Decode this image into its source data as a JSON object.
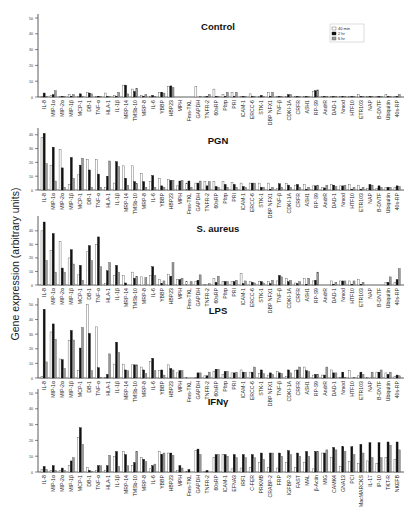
{
  "figure": {
    "ylabel": "Gene expression (arbitrary units)",
    "legend": [
      {
        "label": "40 min",
        "color": "#ffffff",
        "stroke": "#555555"
      },
      {
        "label": "2 hr",
        "color": "#111111",
        "stroke": "#111111"
      },
      {
        "label": "6 hr",
        "color": "#9a9a9a",
        "stroke": "#555555"
      }
    ]
  },
  "chart_data": [
    {
      "type": "bar",
      "title": "Control",
      "ylabel": "Gene expression (arbitrary units)",
      "ylim": [
        0,
        50
      ],
      "yticks": [
        0,
        10,
        20,
        30,
        40,
        50
      ],
      "legend_position": "top-right",
      "categories": [
        "IL-8",
        "MIP-1α",
        "MIP-2α",
        "MIP-1β",
        "MCP-1",
        "DB-1",
        "TNF-α",
        "HLA-1",
        "IL-1β",
        "MRP-14",
        "TMSb-10",
        "MRP-8",
        "IL-6",
        "YBBP",
        "HBP23",
        "MPH",
        "Fms-TKL",
        "GAPDH",
        "TNFR-2",
        "60sRP",
        "Pltrp",
        "PRI",
        "ICAM-1",
        "ERCC-6",
        "STK-1",
        "DBP NFX1",
        "TNF-β",
        "CDKI-1A",
        "CRFR",
        "ASH1",
        "RP-S9",
        "AndrR",
        "DAD-1",
        "Nmod",
        "HTF10",
        "ETR103",
        "NAP",
        "B-DNTF",
        "Ubiquitin",
        "40s-RP"
      ],
      "series": [
        {
          "name": "40 min",
          "values": [
            0.5,
            1,
            0.3,
            1.5,
            0.5,
            3,
            0.5,
            2.5,
            1,
            7.5,
            5,
            1,
            0.5,
            3,
            6.5,
            0,
            0,
            6.5,
            0.5,
            5,
            1.5,
            3,
            0.3,
            2,
            0.3,
            3,
            0.3,
            0.5,
            0.3,
            0.3,
            3.5,
            0.3,
            0.3,
            0.3,
            0.3,
            1.5,
            0.3,
            0.3,
            1.5,
            0.3
          ]
        },
        {
          "name": "2 hr",
          "values": [
            2.5,
            1.5,
            0.3,
            0.5,
            2,
            2.5,
            0.5,
            0.3,
            0.5,
            7.5,
            3.5,
            0.5,
            1,
            3,
            7,
            0,
            0,
            0,
            0.3,
            0.3,
            0.3,
            0.3,
            0.3,
            0.3,
            1,
            0.3,
            0.3,
            1.5,
            0.3,
            0.3,
            4,
            0.3,
            0.3,
            0.3,
            0.3,
            0.3,
            0.3,
            0.3,
            0.3,
            0.3
          ]
        },
        {
          "name": "6 hr",
          "values": [
            0.5,
            4,
            0.3,
            1.5,
            0.5,
            2,
            0.5,
            0.3,
            3,
            2,
            5.5,
            1.5,
            0.5,
            2.5,
            6,
            0,
            0,
            0.3,
            1.5,
            0.3,
            3,
            3,
            0.3,
            0.3,
            0.3,
            3,
            0.3,
            1.5,
            0.3,
            0.3,
            4.5,
            0.3,
            0.3,
            0.3,
            0.3,
            0.3,
            0.3,
            0.3,
            0.3,
            1.5
          ]
        }
      ]
    },
    {
      "type": "bar",
      "title": "PGN",
      "ylabel": "Gene expression (arbitrary units)",
      "ylim": [
        0,
        42
      ],
      "yticks": [
        0,
        10,
        20,
        30,
        40
      ],
      "categories": [
        "IL-8",
        "MIP-1α",
        "MIP-2α",
        "MIP-1β",
        "MCP-1",
        "DB-1",
        "TNF-α",
        "HLA-1",
        "IL-1β",
        "MRP-14",
        "TMSb-10",
        "MRP-8",
        "IL-6",
        "YBBP",
        "HBP23",
        "MPH",
        "Fms-TKL",
        "GAPDH",
        "TNFR-2",
        "60sRP",
        "Pltrp",
        "PRI",
        "ICAM-1",
        "ERCC-6",
        "STK-1",
        "DBP NFX1",
        "TNF-β",
        "CDKI-1A",
        "CRFR",
        "ASH1",
        "RP-S9",
        "AndrR",
        "DAD-1",
        "Nmod",
        "HTF10",
        "ETR103",
        "NAP",
        "B-DNTF",
        "Ubiquitin",
        "40s-RP"
      ],
      "series": [
        {
          "name": "40 min",
          "values": [
            38,
            18,
            29.5,
            4,
            11,
            22,
            22,
            2,
            5,
            17.5,
            17.5,
            12,
            6,
            8.5,
            7.5,
            3,
            5,
            5,
            6,
            6,
            6,
            5.5,
            5,
            5,
            5,
            5,
            1,
            4.5,
            3.5,
            4,
            3,
            2,
            4,
            3,
            4,
            3.5,
            1,
            1,
            2,
            2
          ]
        },
        {
          "name": "2 hr",
          "values": [
            41,
            31,
            16,
            23.5,
            18,
            14.5,
            11.5,
            10,
            20.5,
            8.5,
            6,
            6,
            10.5,
            3,
            7,
            6.5,
            6.5,
            5,
            3,
            2.5,
            4,
            4,
            2.5,
            5,
            2,
            0.5,
            4.5,
            3.5,
            4,
            0.5,
            3,
            1.5,
            3.5,
            3,
            0.5,
            0.5,
            4,
            3,
            2,
            3
          ]
        },
        {
          "name": "6 hr",
          "values": [
            19,
            6.5,
            2,
            8.5,
            23,
            2,
            2,
            21,
            17,
            3.5,
            4.5,
            2,
            2,
            2,
            7,
            7,
            2,
            6.5,
            6,
            2,
            2,
            2,
            2,
            5,
            2,
            2,
            2,
            2,
            2,
            2,
            3.5,
            3.5,
            2.5,
            3.5,
            2,
            2,
            3.5,
            2,
            2,
            2.5
          ]
        }
      ]
    },
    {
      "type": "bar",
      "title": "S. aureus",
      "ylabel": "Gene expression (arbitrary units)",
      "ylim": [
        0,
        48
      ],
      "yticks": [
        0,
        10,
        20,
        30,
        40
      ],
      "categories": [
        "IL-8",
        "MIP-1α",
        "MIP-2α",
        "MIP-1β",
        "MCP-1",
        "DB-1",
        "TNF-α",
        "HLA-1",
        "IL-1β",
        "MRP-14",
        "TMSb-10",
        "MRP-8",
        "IL-6",
        "YBBP",
        "HBP23",
        "MPH",
        "Fms-TKL",
        "GAPDH",
        "TNFR-2",
        "60sRP",
        "Pltrp",
        "PRI",
        "ICAM-1",
        "ERCC-6",
        "STK-1",
        "DBP NFX1",
        "TNF-β",
        "CDKI-1A",
        "CRFR",
        "ASH1",
        "RP-S9",
        "AndrR",
        "DAD-1",
        "Nmod",
        "HTF10",
        "ETR103",
        "NAP",
        "B-DNTF",
        "Ubiquitin",
        "40s-RP"
      ],
      "series": [
        {
          "name": "40 min",
          "values": [
            40,
            25.5,
            32,
            20,
            7.5,
            24.5,
            30,
            1,
            7,
            7,
            9.5,
            6,
            7,
            4,
            8,
            4,
            2.5,
            2.5,
            0.5,
            5,
            2.5,
            2.5,
            8.5,
            2.5,
            2.5,
            2.5,
            3,
            5,
            1.5,
            5,
            3,
            0,
            3,
            3,
            3,
            4,
            0,
            0,
            2,
            2
          ]
        },
        {
          "name": "2 hr",
          "values": [
            46.5,
            38,
            12.5,
            26,
            14.5,
            29,
            35.5,
            10.5,
            14.5,
            1.5,
            5,
            0,
            13.5,
            1,
            6.5,
            4,
            0,
            3.5,
            0,
            2,
            2.5,
            2.5,
            1,
            2,
            2.5,
            1,
            7,
            2.5,
            1,
            0.5,
            3.5,
            0,
            0.5,
            3,
            0.5,
            0.5,
            0,
            0,
            2,
            4
          ]
        },
        {
          "name": "6 hr",
          "values": [
            18,
            9.5,
            9.5,
            15.5,
            3.5,
            18,
            13.5,
            16.5,
            9.5,
            0,
            6.5,
            5.5,
            7,
            3,
            16.5,
            5,
            2.5,
            7.5,
            1,
            6.5,
            2.5,
            3.5,
            3,
            1.5,
            1.5,
            3.5,
            6,
            3.5,
            2.5,
            5,
            9.5,
            0,
            2,
            3,
            3,
            2,
            0,
            0,
            6,
            12
          ]
        }
      ]
    },
    {
      "type": "bar",
      "title": "LPS",
      "ylabel": "Gene expression (arbitrary units)",
      "ylim": [
        0,
        52
      ],
      "yticks": [
        0,
        10,
        20,
        30,
        40,
        50
      ],
      "categories": [
        "IL-8",
        "MIP-1α",
        "MIP-2α",
        "MIP-1β",
        "MCP-1",
        "DB-1",
        "TNF-α",
        "HLA-1",
        "IL-1β",
        "MRP-14",
        "TMSb-10",
        "MRP-8",
        "IL-6",
        "YBBP",
        "HBP23",
        "MPH",
        "Fms-TKL",
        "GAPDH",
        "TNFR-2",
        "60sRP",
        "Pltrp",
        "PRI",
        "ICAM-1",
        "ERCC-6",
        "STK-1",
        "DBP NFX1",
        "TNF-β",
        "CDKI-1A",
        "CRFR",
        "ASH1",
        "RP-S9",
        "AndrR",
        "DAD-1",
        "Nmod",
        "HTF10",
        "ETR103",
        "NAP",
        "B-DNTF",
        "Ubiquitin",
        "40s-RP"
      ],
      "series": [
        {
          "name": "40 min",
          "values": [
            1,
            31.5,
            13,
            25.5,
            5,
            50.5,
            35,
            0.5,
            9.5,
            9.5,
            9,
            7.5,
            11.5,
            5,
            9,
            3.5,
            0.5,
            0.5,
            1.5,
            4.5,
            2.5,
            3.5,
            5.5,
            4,
            3,
            2,
            4.5,
            1,
            5,
            7.5,
            2,
            2,
            5.5,
            0.5,
            5,
            1.5,
            0.5,
            4,
            3.5,
            1
          ]
        },
        {
          "name": "2 hr",
          "values": [
            47,
            37,
            12.5,
            32.5,
            20.5,
            30.5,
            7,
            2.5,
            24.5,
            5.5,
            9,
            5.5,
            13.5,
            5.5,
            6.5,
            5,
            0,
            3.5,
            1.5,
            6,
            4.5,
            3.5,
            4,
            4,
            5.5,
            3.5,
            3.5,
            5.5,
            5.5,
            5,
            2.5,
            2,
            3.5,
            4,
            0,
            4,
            0,
            4,
            2.5,
            2
          ]
        },
        {
          "name": "6 hr",
          "values": [
            11,
            26.5,
            6.5,
            26,
            34.5,
            5,
            0.5,
            16.5,
            17.5,
            5,
            9,
            3,
            5,
            2,
            5.5,
            5,
            0,
            3.5,
            4,
            6,
            4.5,
            4,
            4,
            7.5,
            3,
            2.5,
            3,
            3.5,
            7.5,
            4.5,
            2.5,
            7.5,
            3.5,
            0.5,
            0.5,
            2.5,
            4,
            5.5,
            4,
            1.5
          ]
        }
      ]
    },
    {
      "type": "bar",
      "title": "IFNγ",
      "ylabel": "Gene expression (arbitrary units)",
      "ylim": [
        0,
        50
      ],
      "yticks": [
        0,
        10,
        20,
        30,
        40,
        50
      ],
      "categories": [
        "IL-8",
        "MIP-1α",
        "MIP-2α",
        "MIP-1β",
        "MCP-1",
        "DB-1",
        "TNF-α",
        "HLA-1",
        "IL-1β",
        "MRP-14",
        "TMSb-10",
        "MRP-8",
        "IL-6",
        "YBBP",
        "HBP23",
        "MPH",
        "Fms-TKL",
        "GAPDH",
        "TNFR-2",
        "60sRP",
        "ICAM-1",
        "EFNA3",
        "IRF1",
        "C-FER",
        "PRKMB",
        "CRABP-2",
        "FRP",
        "IGFBP-3",
        "FAST",
        "MAL",
        "β-Actin",
        "MIG",
        "CAMK4",
        "GNA13",
        "PCI",
        "MacMARCKS",
        "IL-17",
        "IP-10",
        "TKT-R",
        "NKEFB"
      ],
      "series": [
        {
          "name": "40 min",
          "values": [
            1.5,
            1,
            1,
            4,
            22,
            3,
            1,
            1,
            10,
            13,
            4,
            9,
            2,
            13,
            12,
            1,
            0.5,
            13.5,
            0.5,
            9,
            11,
            2,
            2.5,
            3,
            6,
            3,
            2.5,
            6,
            3,
            6,
            2,
            12,
            9,
            3.5,
            6.5,
            5.5,
            7,
            5.5,
            9,
            8
          ]
        },
        {
          "name": "2 hr",
          "values": [
            3.5,
            4,
            2.5,
            7,
            28,
            1,
            4,
            4,
            13,
            11,
            6,
            8,
            4,
            11,
            12,
            4,
            1.5,
            14.5,
            1,
            11,
            11,
            11,
            11,
            11,
            12,
            12,
            12,
            13.5,
            12,
            13,
            13,
            12,
            15.5,
            16,
            16,
            17.5,
            18.5,
            18.5,
            19,
            19
          ]
        },
        {
          "name": "6 hr",
          "values": [
            1.5,
            1,
            1,
            9,
            17.5,
            0.5,
            4,
            10.5,
            3.5,
            4,
            13,
            6.5,
            5,
            12,
            10.5,
            2.5,
            0,
            11,
            0,
            11,
            10,
            9,
            9,
            9,
            8,
            12,
            10,
            11,
            10,
            10,
            13,
            14,
            14,
            13,
            11,
            12,
            9,
            9,
            17,
            14
          ]
        }
      ]
    }
  ]
}
